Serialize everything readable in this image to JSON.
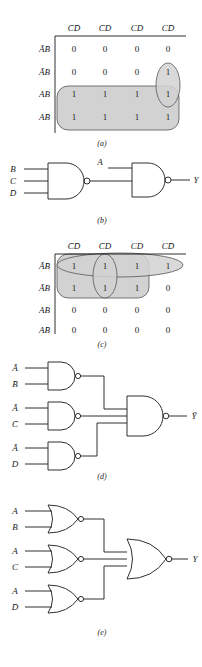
{
  "page": {
    "width": 202,
    "height": 667,
    "background": "#ffffff",
    "ink": "#1a1a1a",
    "shade_fill": "#d2d2d2",
    "shade_stroke": "#555555"
  },
  "panels": [
    {
      "id": "a",
      "caption": "(a)",
      "type": "karnaugh-map",
      "column_headers": [
        "C̄D̄",
        "C̄D",
        "CD",
        "CD̄"
      ],
      "row_headers": [
        "ĀB̄",
        "ĀB",
        "AB",
        "AB̄"
      ],
      "cells": [
        [
          "0",
          "0",
          "0",
          "0"
        ],
        [
          "0",
          "0",
          "0",
          "1"
        ],
        [
          "1",
          "1",
          "1",
          "1"
        ],
        [
          "1",
          "1",
          "1",
          "1"
        ]
      ],
      "groupings": [
        {
          "name": "group-rows-3-4-all-columns",
          "shape": "rounded-rect",
          "rows": [
            3,
            4
          ],
          "cols": [
            1,
            2,
            3,
            4
          ]
        },
        {
          "name": "group-column-4-rows-2-3",
          "shape": "vertical-oval",
          "rows": [
            2,
            3
          ],
          "cols": [
            4
          ]
        }
      ]
    },
    {
      "id": "b",
      "caption": "(b)",
      "type": "logic-circuit",
      "gates": [
        {
          "name": "nand-gate-1",
          "kind": "NAND",
          "inputs": [
            "B",
            "C",
            "D̄"
          ]
        },
        {
          "name": "nand-gate-2",
          "kind": "NAND",
          "inputs": [
            "A",
            "nand-gate-1"
          ]
        }
      ],
      "output": "Y"
    },
    {
      "id": "c",
      "caption": "(c)",
      "type": "karnaugh-map",
      "column_headers": [
        "C̄D̄",
        "C̄D",
        "CD",
        "CD̄"
      ],
      "row_headers": [
        "ĀB̄",
        "ĀB",
        "AB",
        "AB̄"
      ],
      "cells": [
        [
          "1",
          "1",
          "1",
          "1"
        ],
        [
          "1",
          "1",
          "1",
          "0"
        ],
        [
          "0",
          "0",
          "0",
          "0"
        ],
        [
          "0",
          "0",
          "0",
          "0"
        ]
      ],
      "groupings": [
        {
          "name": "group-row-1-all-columns",
          "shape": "horizontal-ellipse",
          "rows": [
            1
          ],
          "cols": [
            1,
            2,
            3,
            4
          ]
        },
        {
          "name": "group-column-2-rows-1-2",
          "shape": "vertical-oval",
          "rows": [
            1,
            2
          ],
          "cols": [
            2
          ]
        },
        {
          "name": "group-rows-1-2-columns-1-3",
          "shape": "rounded-rect",
          "rows": [
            1,
            2
          ],
          "cols": [
            1,
            2,
            3
          ]
        }
      ]
    },
    {
      "id": "d",
      "caption": "(d)",
      "type": "logic-circuit",
      "gates": [
        {
          "name": "nand-gate-1",
          "kind": "NAND",
          "inputs": [
            "Ā",
            "B̄"
          ]
        },
        {
          "name": "nand-gate-2",
          "kind": "NAND",
          "inputs": [
            "Ā",
            "C̄"
          ]
        },
        {
          "name": "nand-gate-3",
          "kind": "NAND",
          "inputs": [
            "Ā",
            "D"
          ]
        },
        {
          "name": "nand-gate-4",
          "kind": "NAND",
          "inputs": [
            "nand-gate-1",
            "nand-gate-2",
            "nand-gate-3"
          ]
        }
      ],
      "output": "Ȳ"
    },
    {
      "id": "e",
      "caption": "(e)",
      "type": "logic-circuit",
      "gates": [
        {
          "name": "nor-gate-1",
          "kind": "NOR",
          "inputs": [
            "A",
            "B"
          ]
        },
        {
          "name": "nor-gate-2",
          "kind": "NOR",
          "inputs": [
            "A",
            "C"
          ]
        },
        {
          "name": "nor-gate-3",
          "kind": "NOR",
          "inputs": [
            "A",
            "D̄"
          ]
        },
        {
          "name": "nor-gate-4",
          "kind": "NOR",
          "inputs": [
            "nor-gate-1",
            "nor-gate-2",
            "nor-gate-3"
          ]
        }
      ],
      "output": "Y"
    }
  ],
  "labels": {
    "a": {
      "col": [
        "C̄D̄",
        "C̄D",
        "CD",
        "CD̄"
      ],
      "row": [
        "ĀB̄",
        "ĀB",
        "AB",
        "AB̄"
      ],
      "r1": [
        "0",
        "0",
        "0",
        "0"
      ],
      "r2": [
        "0",
        "0",
        "0",
        "1"
      ],
      "r3": [
        "1",
        "1",
        "1",
        "1"
      ],
      "r4": [
        "1",
        "1",
        "1",
        "1"
      ],
      "caption": "(a)"
    },
    "b": {
      "in": [
        "B",
        "C",
        "D̄"
      ],
      "a_in": "A",
      "out": "Y",
      "caption": "(b)"
    },
    "c": {
      "col": [
        "C̄D̄",
        "C̄D",
        "CD",
        "CD̄"
      ],
      "row": [
        "ĀB̄",
        "ĀB",
        "AB",
        "AB̄"
      ],
      "r1": [
        "1",
        "1",
        "1",
        "1"
      ],
      "r2": [
        "1",
        "1",
        "1",
        "0"
      ],
      "r3": [
        "0",
        "0",
        "0",
        "0"
      ],
      "r4": [
        "0",
        "0",
        "0",
        "0"
      ],
      "caption": "(c)"
    },
    "d": {
      "in": [
        "Ā",
        "B̄",
        "Ā",
        "C̄",
        "Ā",
        "D"
      ],
      "out": "Ȳ",
      "caption": "(d)"
    },
    "e": {
      "in": [
        "A",
        "B",
        "A",
        "C",
        "A",
        "D̄"
      ],
      "out": "Y",
      "caption": "(e)"
    }
  }
}
